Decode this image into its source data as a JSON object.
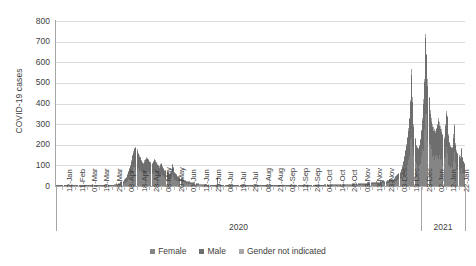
{
  "chart": {
    "type": "bar",
    "ylabel": "COVID-19 cases",
    "xlabel": ""
  },
  "legend": {
    "position": "bottom",
    "items": [
      {
        "label": "Female",
        "color": "#858585"
      },
      {
        "label": "Male",
        "color": "#6e6e6e"
      },
      {
        "label": "Gender not indicated",
        "color": "#a8a8a8"
      }
    ]
  },
  "yaxis": {
    "ticks": [
      "0",
      "100",
      "200",
      "300",
      "400",
      "500",
      "600",
      "700",
      "800"
    ]
  },
  "xaxis": {
    "tick_labels": [
      "12-Jan",
      "11-Feb",
      "07-Mar",
      "19-Mar",
      "29-Mar",
      "08-Apr",
      "18-Apr",
      "28-Apr",
      "08-May",
      "20-May",
      "01-Jun",
      "12-Jun",
      "25-Jun",
      "08-Jul",
      "19-Jul",
      "29-Jul",
      "08-Aug",
      "21-Aug",
      "02-Sep",
      "12-Sep",
      "24-Sep",
      "04-Oct",
      "14-Oct",
      "24-Oct",
      "03-Nov",
      "13-Nov",
      "23-Nov",
      "03-Dec",
      "13-Dec",
      "23-Dec",
      "02-Jan",
      "12-Jan",
      "22-Jan"
    ],
    "groups": [
      {
        "label": "2020"
      },
      {
        "label": "2021"
      }
    ]
  },
  "chart_data": {
    "type": "bar",
    "stacked": true,
    "title": "",
    "xlabel": "",
    "ylabel": "COVID-19 cases",
    "ylim": [
      0,
      800
    ],
    "ytick_step": 100,
    "grid": true,
    "legend_position": "bottom",
    "x_tick_labels": [
      "12-Jan",
      "11-Feb",
      "07-Mar",
      "19-Mar",
      "29-Mar",
      "08-Apr",
      "18-Apr",
      "28-Apr",
      "08-May",
      "20-May",
      "01-Jun",
      "12-Jun",
      "25-Jun",
      "08-Jul",
      "19-Jul",
      "29-Jul",
      "08-Aug",
      "21-Aug",
      "02-Sep",
      "12-Sep",
      "24-Sep",
      "04-Oct",
      "14-Oct",
      "24-Oct",
      "03-Nov",
      "13-Nov",
      "23-Nov",
      "03-Dec",
      "13-Dec",
      "23-Dec",
      "02-Jan",
      "12-Jan",
      "22-Jan"
    ],
    "x_group_labels": [
      "2020",
      "2021"
    ],
    "series": [
      {
        "name": "Female",
        "color": "#858585"
      },
      {
        "name": "Male",
        "color": "#6e6e6e"
      },
      {
        "name": "Gender not indicated",
        "color": "#a8a8a8"
      }
    ],
    "totals": [
      0,
      0,
      0,
      0,
      0,
      0,
      0,
      0,
      0,
      0,
      1,
      0,
      0,
      0,
      0,
      0,
      0,
      0,
      0,
      0,
      0,
      0,
      1,
      0,
      0,
      0,
      0,
      2,
      1,
      0,
      0,
      1,
      3,
      2,
      1,
      0,
      1,
      2,
      1,
      0,
      1,
      2,
      1,
      2,
      3,
      1,
      2,
      3,
      4,
      3,
      5,
      4,
      6,
      5,
      8,
      7,
      10,
      9,
      13,
      12,
      16,
      20,
      24,
      31,
      38,
      46,
      58,
      72,
      88,
      104,
      126,
      150,
      172,
      186,
      190,
      178,
      160,
      150,
      142,
      126,
      118,
      110,
      124,
      132,
      140,
      138,
      132,
      122,
      118,
      112,
      120,
      128,
      124,
      116,
      108,
      100,
      96,
      104,
      112,
      98,
      88,
      80,
      76,
      70,
      64,
      58,
      62,
      74,
      108,
      92,
      70,
      62,
      56,
      50,
      46,
      42,
      40,
      36,
      34,
      30,
      28,
      26,
      24,
      22,
      20,
      18,
      17,
      16,
      15,
      14,
      13,
      12,
      11,
      10,
      10,
      9,
      9,
      8,
      8,
      7,
      7,
      6,
      6,
      6,
      5,
      5,
      5,
      4,
      4,
      4,
      40,
      8,
      4,
      4,
      3,
      3,
      3,
      3,
      3,
      2,
      2,
      2,
      2,
      2,
      3,
      3,
      2,
      2,
      2,
      2,
      2,
      2,
      2,
      3,
      3,
      2,
      2,
      2,
      2,
      2,
      2,
      2,
      3,
      3,
      3,
      2,
      2,
      2,
      2,
      3,
      3,
      3,
      3,
      2,
      2,
      2,
      3,
      3,
      3,
      3,
      3,
      3,
      3,
      4,
      4,
      3,
      3,
      3,
      3,
      4,
      4,
      4,
      4,
      3,
      3,
      3,
      4,
      4,
      4,
      4,
      4,
      4,
      4,
      5,
      5,
      4,
      4,
      4,
      5,
      5,
      5,
      5,
      5,
      4,
      4,
      5,
      5,
      6,
      6,
      5,
      5,
      5,
      6,
      6,
      6,
      6,
      6,
      5,
      5,
      6,
      7,
      7,
      7,
      6,
      6,
      6,
      7,
      8,
      8,
      8,
      7,
      7,
      7,
      8,
      9,
      9,
      9,
      8,
      8,
      9,
      10,
      10,
      10,
      9,
      9,
      10,
      11,
      12,
      12,
      11,
      10,
      10,
      12,
      13,
      14,
      14,
      13,
      12,
      13,
      15,
      16,
      17,
      16,
      15,
      15,
      17,
      19,
      20,
      21,
      19,
      18,
      19,
      22,
      24,
      26,
      26,
      24,
      24,
      27,
      30,
      33,
      36,
      34,
      32,
      34,
      40,
      46,
      52,
      58,
      62,
      70,
      84,
      100,
      120,
      145,
      175,
      205,
      240,
      280,
      330,
      415,
      565,
      430,
      300,
      230,
      200,
      190,
      185,
      200,
      230,
      270,
      330,
      420,
      520,
      735,
      640,
      520,
      430,
      370,
      330,
      300,
      285,
      275,
      265,
      280,
      300,
      330,
      310,
      290,
      275,
      250,
      240,
      300,
      365,
      340,
      250,
      215,
      200,
      190,
      185,
      250,
      300,
      210,
      175,
      160,
      150,
      145,
      185,
      140,
      120,
      110
    ],
    "peak_first_wave": {
      "value": 190,
      "label": "late March 2020"
    },
    "peak_second_wave": {
      "value": 735,
      "label": "early January 2021"
    }
  }
}
